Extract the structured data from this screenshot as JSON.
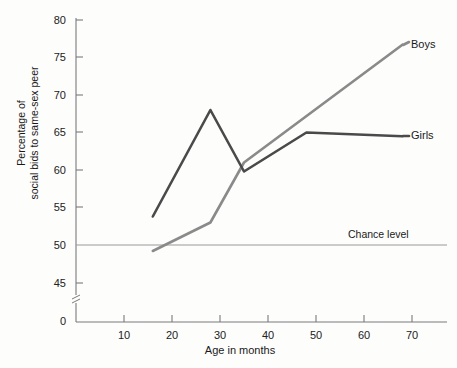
{
  "chart_data": {
    "type": "line",
    "title": "",
    "xlabel": "Age in months",
    "ylabel": "Percentage of\nsocial bids to same-sex peer",
    "ylabel_line1": "Percentage of",
    "ylabel_line2": "social bids to same-sex peer",
    "xlim": [
      0,
      75
    ],
    "ylim": [
      43.5,
      80
    ],
    "grid": false,
    "legend_position": "right-inline",
    "xticks": [
      10,
      20,
      30,
      40,
      50,
      60,
      70
    ],
    "xtick_labels": [
      "10",
      "20",
      "30",
      "40",
      "50",
      "60",
      "70"
    ],
    "yticks": [
      0,
      45,
      50,
      55,
      60,
      65,
      70,
      75,
      80
    ],
    "ytick_labels": [
      "0",
      "45",
      "50",
      "55",
      "60",
      "65",
      "70",
      "75",
      "80"
    ],
    "y_axis_break": true,
    "annotations": [
      {
        "text": "Chance level",
        "value": 50
      }
    ],
    "series": [
      {
        "name": "Boys",
        "color": "#8a8a8a",
        "x": [
          16,
          28,
          35,
          68
        ],
        "values": [
          49.2,
          53.0,
          61.0,
          76.7
        ]
      },
      {
        "name": "Girls",
        "color": "#4a4a4a",
        "x": [
          16,
          28,
          35,
          48,
          68
        ],
        "values": [
          53.8,
          68.0,
          59.8,
          65.0,
          64.5
        ]
      }
    ]
  },
  "labels": {
    "boys": "Boys",
    "girls": "Girls",
    "chance_level": "Chance level",
    "x_axis_title": "Age in months",
    "y_axis_title_line1": "Percentage of",
    "y_axis_title_line2": "social bids to same-sex peer",
    "ytick_80": "80",
    "ytick_75": "75",
    "ytick_70": "70",
    "ytick_65": "65",
    "ytick_60": "60",
    "ytick_55": "55",
    "ytick_50": "50",
    "ytick_45": "45",
    "ytick_0": "0",
    "xtick_10": "10",
    "xtick_20": "20",
    "xtick_30": "30",
    "xtick_40": "40",
    "xtick_50": "50",
    "xtick_60": "60",
    "xtick_70": "70"
  },
  "colors": {
    "boys_line": "#8a8a8a",
    "girls_line": "#4a4a4a",
    "chance_line": "#9a9a9a",
    "axis": "#7a7a7a",
    "background": "#fdfdfc"
  }
}
